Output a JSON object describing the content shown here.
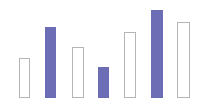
{
  "chart_data": {
    "type": "bar",
    "title": "",
    "subtitle": "",
    "xlabel": "",
    "ylabel": "",
    "categories": [
      "1",
      "2",
      "3",
      "4",
      "5",
      "6",
      "7"
    ],
    "values": [
      40,
      71,
      51,
      31,
      66,
      88,
      76
    ],
    "ylim": [
      0,
      98
    ],
    "grid": false,
    "legend": null,
    "legend_position": "none",
    "axis_visible": false,
    "tick_labels_visible": false,
    "series": [
      {
        "name": "values",
        "values": [
          40,
          71,
          51,
          31,
          66,
          88,
          76
        ]
      }
    ],
    "bars": [
      {
        "index": 0,
        "category": "1",
        "value": 40,
        "style": "outlined",
        "x": 19,
        "width": 11,
        "top": 58,
        "height": 40
      },
      {
        "index": 1,
        "category": "2",
        "value": 71,
        "style": "filled",
        "x": 45,
        "width": 11,
        "top": 27,
        "height": 71
      },
      {
        "index": 2,
        "category": "3",
        "value": 51,
        "style": "outlined",
        "x": 72,
        "width": 12,
        "top": 47,
        "height": 51
      },
      {
        "index": 3,
        "category": "4",
        "value": 31,
        "style": "filled",
        "x": 98,
        "width": 11,
        "top": 67,
        "height": 31
      },
      {
        "index": 4,
        "category": "5",
        "value": 66,
        "style": "outlined",
        "x": 124,
        "width": 12,
        "top": 32,
        "height": 66
      },
      {
        "index": 5,
        "category": "6",
        "value": 88,
        "style": "filled",
        "x": 151,
        "width": 12,
        "top": 10,
        "height": 88
      },
      {
        "index": 6,
        "category": "7",
        "value": 76,
        "style": "outlined",
        "x": 177,
        "width": 13,
        "top": 22,
        "height": 76
      }
    ],
    "colors": {
      "filled_bar": "#6d6db6",
      "outlined_bar_stroke": "#b5b5b5",
      "outlined_bar_fill": "#ffffff",
      "background": "#ffffff"
    }
  }
}
